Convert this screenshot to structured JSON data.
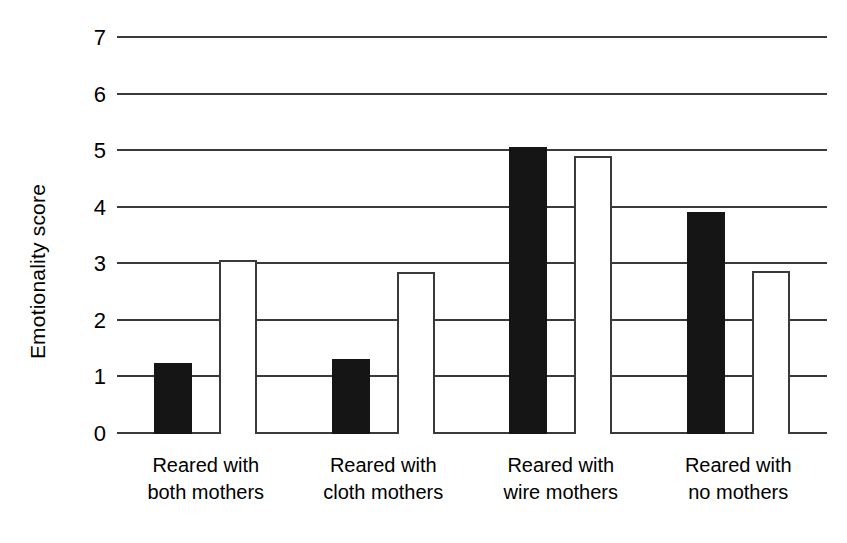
{
  "chart_data": {
    "type": "bar",
    "title": "",
    "xlabel": "",
    "ylabel": "Emotionality score",
    "ylim": [
      0,
      7
    ],
    "yticks": [
      0,
      1,
      2,
      3,
      4,
      5,
      6,
      7
    ],
    "ytick_labels": [
      "0",
      "1",
      "2",
      "3",
      "4",
      "5",
      "6",
      "7"
    ],
    "grid": true,
    "legend": "none",
    "categories": [
      "Reared with both mothers",
      "Reared with cloth mothers",
      "Reared with wire mothers",
      "Reared with no mothers"
    ],
    "category_lines": [
      [
        "Reared with",
        "both mothers"
      ],
      [
        "Reared with",
        "cloth mothers"
      ],
      [
        "Reared with",
        "wire mothers"
      ],
      [
        "Reared with",
        "no mothers"
      ]
    ],
    "series": [
      {
        "name": "filled",
        "style": "solid-black",
        "color": "#151515",
        "values": [
          1.25,
          1.33,
          5.08,
          3.93
        ]
      },
      {
        "name": "open",
        "style": "white-outlined",
        "color": "#ffffff",
        "values": [
          3.08,
          2.86,
          4.92,
          2.88
        ]
      }
    ]
  },
  "colors": {
    "axis": "#3a3a3a",
    "bar_filled": "#151515",
    "bar_open_fill": "#ffffff",
    "bar_open_stroke": "#3a3a3a",
    "background": "#ffffff"
  }
}
